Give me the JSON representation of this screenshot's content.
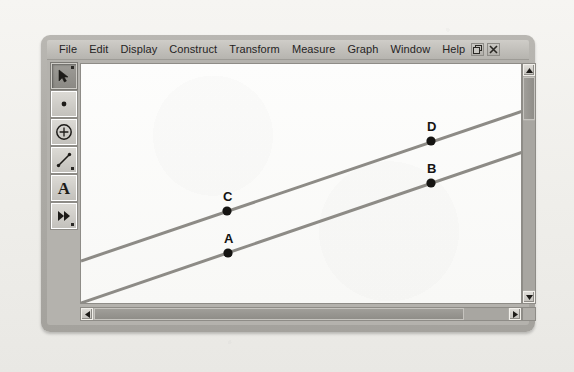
{
  "app": {
    "title": "Geometer's Sketchpad",
    "menu": [
      {
        "label": "File"
      },
      {
        "label": "Edit"
      },
      {
        "label": "Display"
      },
      {
        "label": "Construct"
      },
      {
        "label": "Transform"
      },
      {
        "label": "Measure"
      },
      {
        "label": "Graph"
      },
      {
        "label": "Window"
      },
      {
        "label": "Help"
      }
    ],
    "window_buttons": [
      {
        "name": "restore-button",
        "glyph": "restore"
      },
      {
        "name": "close-button",
        "glyph": "close"
      }
    ]
  },
  "toolbar": {
    "tools": [
      {
        "name": "selection-arrow-tool",
        "icon": "arrow-icon",
        "selected": true
      },
      {
        "name": "point-tool",
        "icon": "point-icon",
        "selected": false
      },
      {
        "name": "compass-circle-tool",
        "icon": "circle-icon",
        "selected": false
      },
      {
        "name": "straightedge-tool",
        "icon": "line-segment-icon",
        "selected": false
      },
      {
        "name": "text-tool",
        "icon": "letter-a-icon",
        "label": "A",
        "selected": false
      },
      {
        "name": "custom-transform-tool",
        "icon": "double-arrow-icon",
        "selected": false
      }
    ]
  },
  "canvas": {
    "ghost_text": "",
    "background_color": "#fbfbfa",
    "line_color": "#8d8b86",
    "point_color": "#151412",
    "lines": [
      {
        "name": "upper-line",
        "x1": 0,
        "y1": 197,
        "x2": 442,
        "y2": 47
      },
      {
        "name": "lower-line",
        "x1": 0,
        "y1": 239,
        "x2": 442,
        "y2": 88
      }
    ],
    "points": [
      {
        "label": "C",
        "x": 146,
        "y": 147,
        "label_dx": -4,
        "label_dy": -22,
        "line": "upper-line"
      },
      {
        "label": "D",
        "x": 350,
        "y": 77,
        "label_dx": -4,
        "label_dy": -22,
        "line": "upper-line"
      },
      {
        "label": "A",
        "x": 147,
        "y": 189,
        "label_dx": -4,
        "label_dy": -22,
        "line": "lower-line"
      },
      {
        "label": "B",
        "x": 350,
        "y": 119,
        "label_dx": -4,
        "label_dy": -22,
        "line": "lower-line"
      }
    ]
  },
  "scrollbars": {
    "vertical": {
      "name": "vertical-scrollbar",
      "up": "▲",
      "down": "▼"
    },
    "horizontal": {
      "name": "horizontal-scrollbar",
      "left": "◀",
      "right": "▶"
    }
  },
  "colors": {
    "frame": "#b4b2ad",
    "menubar": "#c5c3be",
    "line": "#8d8b86",
    "point": "#151412"
  }
}
